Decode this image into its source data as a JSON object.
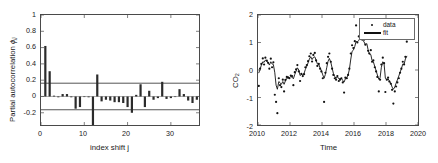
{
  "figure": {
    "background": "#ffffff",
    "axis_color": "#4a4a4a",
    "bar_color": "#2b2b2b",
    "bound_color": "#555555",
    "marker_color": "#111111",
    "line_color": "#111111"
  },
  "panels": {
    "left": {
      "name": "partial-autocorrelation-plot",
      "ylabel_main": "Partial autocorrelation ",
      "ylabel_symbol": "ϕ",
      "ylabel_sub": "jj",
      "xlabel": "index shift j",
      "yticks": [
        "1",
        "0.8",
        "0.6",
        "0.4",
        "0.2",
        "0",
        "-0.2"
      ],
      "xticks": [
        "0",
        "10",
        "20",
        "30"
      ]
    },
    "right": {
      "name": "co2-timeseries-plot",
      "ylabel_main": "CO",
      "ylabel_sub": "2",
      "xlabel": "Time",
      "yticks": [
        "2",
        "1",
        "0",
        "-1",
        "-2"
      ],
      "xticks": [
        "2010",
        "2012",
        "2014",
        "2016",
        "2018",
        "2020"
      ],
      "legend": {
        "data_label": "data",
        "fit_label": "fit"
      }
    }
  },
  "chart_data": [
    {
      "type": "bar",
      "name": "partial-autocorrelation",
      "title": "",
      "xlabel": "index shift j",
      "ylabel": "Partial autocorrelation ϕ_jj",
      "xlim": [
        0,
        36.5
      ],
      "ylim": [
        -0.35,
        1.0
      ],
      "xticks": [
        0,
        10,
        20,
        30
      ],
      "yticks": [
        -0.2,
        0,
        0.2,
        0.4,
        0.6,
        0.8,
        1
      ],
      "grid": false,
      "confidence_bounds": [
        0.163,
        -0.163
      ],
      "x": [
        1,
        2,
        3,
        4,
        5,
        6,
        7,
        8,
        9,
        10,
        11,
        12,
        13,
        14,
        15,
        16,
        17,
        18,
        19,
        20,
        21,
        22,
        23,
        24,
        25,
        26,
        27,
        28,
        29,
        30,
        31,
        32,
        33,
        34,
        35,
        36
      ],
      "values": [
        0.62,
        0.31,
        0.01,
        -0.01,
        0.03,
        0.03,
        -0.01,
        -0.15,
        -0.13,
        0.0,
        -0.01,
        -0.35,
        0.27,
        -0.06,
        -0.04,
        -0.05,
        -0.07,
        -0.07,
        -0.08,
        -0.13,
        -0.2,
        0.02,
        0.15,
        -0.13,
        0.07,
        -0.04,
        -0.02,
        0.18,
        -0.03,
        -0.02,
        0.0,
        0.09,
        0.03,
        -0.05,
        -0.08,
        -0.04
      ]
    },
    {
      "type": "scatter",
      "name": "co2-anomaly-timeseries",
      "title": "",
      "xlabel": "Time",
      "ylabel": "CO2",
      "xlim": [
        2010,
        2020
      ],
      "ylim": [
        -2,
        2
      ],
      "xticks": [
        2010,
        2012,
        2014,
        2016,
        2018,
        2020
      ],
      "yticks": [
        -2,
        -1,
        0,
        1,
        2
      ],
      "grid": false,
      "legend_position": "top-right",
      "series": [
        {
          "name": "data",
          "style": "points",
          "x": [
            2010.05,
            2010.13,
            2010.21,
            2010.3,
            2010.38,
            2010.46,
            2010.55,
            2010.63,
            2010.71,
            2010.8,
            2010.88,
            2010.96,
            2011.05,
            2011.13,
            2011.21,
            2011.3,
            2011.38,
            2011.46,
            2011.55,
            2011.63,
            2011.71,
            2011.8,
            2011.88,
            2011.96,
            2012.05,
            2012.13,
            2012.21,
            2012.3,
            2012.38,
            2012.46,
            2012.55,
            2012.63,
            2012.71,
            2012.8,
            2012.88,
            2012.96,
            2013.05,
            2013.13,
            2013.21,
            2013.3,
            2013.38,
            2013.46,
            2013.55,
            2013.63,
            2013.71,
            2013.8,
            2013.88,
            2013.96,
            2014.05,
            2014.13,
            2014.21,
            2014.3,
            2014.38,
            2014.46,
            2014.55,
            2014.63,
            2014.71,
            2014.8,
            2014.88,
            2014.96,
            2015.05,
            2015.13,
            2015.21,
            2015.3,
            2015.38,
            2015.46,
            2015.55,
            2015.63,
            2015.71,
            2015.8,
            2015.88,
            2015.96,
            2016.05,
            2016.13,
            2016.21,
            2016.3,
            2016.38,
            2016.46,
            2016.55,
            2016.63,
            2016.71,
            2016.8,
            2016.88,
            2016.96,
            2017.05,
            2017.13,
            2017.21,
            2017.3,
            2017.38,
            2017.46,
            2017.55,
            2017.63,
            2017.71,
            2017.8,
            2017.88,
            2017.96,
            2018.05,
            2018.13,
            2018.21,
            2018.3,
            2018.38,
            2018.46,
            2018.55,
            2018.63,
            2018.71,
            2018.8,
            2018.88,
            2018.96,
            2019.05,
            2019.13,
            2019.21,
            2019.3
          ],
          "y": [
            -0.58,
            0.05,
            0.22,
            0.42,
            0.2,
            0.45,
            0.34,
            0.26,
            0.05,
            0.41,
            0.1,
            0.28,
            -0.9,
            -1.16,
            -1.57,
            -0.3,
            -0.55,
            -0.62,
            -0.35,
            -0.78,
            -0.36,
            -0.25,
            -0.27,
            -0.3,
            -0.2,
            -0.22,
            -0.55,
            -0.08,
            0.02,
            0.18,
            -0.05,
            -0.4,
            -0.14,
            -0.22,
            -0.15,
            0.1,
            0.18,
            0.32,
            0.5,
            0.6,
            0.31,
            0.55,
            0.62,
            0.35,
            0.15,
            0.22,
            0.05,
            -0.05,
            -0.3,
            -1.16,
            -0.1,
            0.25,
            0.48,
            0.6,
            0.3,
            0.05,
            -0.18,
            -0.3,
            -0.35,
            -0.22,
            -0.4,
            -0.35,
            -0.3,
            -0.45,
            -0.82,
            -0.28,
            -0.3,
            -0.18,
            0.05,
            0.6,
            0.9,
            0.8,
            1.05,
            1.62,
            1.0,
            1.22,
            1.73,
            1.12,
            1.18,
            1.1,
            0.92,
            1.25,
            0.7,
            0.6,
            0.72,
            0.3,
            0.35,
            0.1,
            -0.05,
            -0.25,
            -0.78,
            -0.35,
            0.2,
            0.45,
            0.25,
            -0.8,
            -0.35,
            -0.28,
            -0.42,
            -0.5,
            -0.72,
            -1.22,
            -0.78,
            -0.6,
            -0.45,
            -0.3,
            -0.1,
            0.05,
            0.3,
            0.2,
            0.48,
            1.03
          ]
        },
        {
          "name": "fit",
          "style": "line",
          "x": [
            2010.05,
            2010.13,
            2010.21,
            2010.3,
            2010.38,
            2010.46,
            2010.55,
            2010.63,
            2010.71,
            2010.8,
            2010.88,
            2010.96,
            2011.05,
            2011.13,
            2011.21,
            2011.3,
            2011.38,
            2011.46,
            2011.55,
            2011.63,
            2011.71,
            2011.8,
            2011.88,
            2011.96,
            2012.05,
            2012.13,
            2012.21,
            2012.3,
            2012.38,
            2012.46,
            2012.55,
            2012.63,
            2012.71,
            2012.8,
            2012.88,
            2012.96,
            2013.05,
            2013.13,
            2013.21,
            2013.3,
            2013.38,
            2013.46,
            2013.55,
            2013.63,
            2013.71,
            2013.8,
            2013.88,
            2013.96,
            2014.05,
            2014.13,
            2014.21,
            2014.3,
            2014.38,
            2014.46,
            2014.55,
            2014.63,
            2014.71,
            2014.8,
            2014.88,
            2014.96,
            2015.05,
            2015.13,
            2015.21,
            2015.3,
            2015.38,
            2015.46,
            2015.55,
            2015.63,
            2015.71,
            2015.8,
            2015.88,
            2015.96,
            2016.05,
            2016.13,
            2016.21,
            2016.3,
            2016.38,
            2016.46,
            2016.55,
            2016.63,
            2016.71,
            2016.8,
            2016.88,
            2016.96,
            2017.05,
            2017.13,
            2017.21,
            2017.3,
            2017.38,
            2017.46,
            2017.55,
            2017.63,
            2017.71,
            2017.8,
            2017.88,
            2017.96,
            2018.05,
            2018.13,
            2018.21,
            2018.3,
            2018.38,
            2018.46,
            2018.55,
            2018.63,
            2018.71,
            2018.8,
            2018.88,
            2018.96,
            2019.05,
            2019.13,
            2019.21,
            2019.3
          ],
          "y": [
            -0.1,
            0.02,
            0.18,
            0.3,
            0.28,
            0.36,
            0.32,
            0.28,
            0.18,
            0.3,
            0.22,
            0.2,
            -0.1,
            -0.55,
            -0.7,
            -0.42,
            -0.46,
            -0.52,
            -0.42,
            -0.52,
            -0.4,
            -0.3,
            -0.28,
            -0.28,
            -0.24,
            -0.26,
            -0.32,
            -0.16,
            -0.04,
            0.08,
            0.0,
            -0.2,
            -0.16,
            -0.18,
            -0.12,
            0.02,
            0.14,
            0.26,
            0.4,
            0.48,
            0.38,
            0.46,
            0.48,
            0.36,
            0.22,
            0.2,
            0.08,
            -0.02,
            -0.18,
            -0.3,
            -0.16,
            0.1,
            0.32,
            0.42,
            0.28,
            0.08,
            -0.12,
            -0.24,
            -0.3,
            -0.24,
            -0.32,
            -0.32,
            -0.3,
            -0.38,
            -0.44,
            -0.32,
            -0.28,
            -0.18,
            0.02,
            0.4,
            0.68,
            0.72,
            0.86,
            1.04,
            1.02,
            1.08,
            1.16,
            1.1,
            1.08,
            1.02,
            0.92,
            0.96,
            0.74,
            0.58,
            0.56,
            0.34,
            0.3,
            0.12,
            -0.02,
            -0.18,
            -0.34,
            -0.28,
            0.1,
            0.3,
            0.22,
            -0.3,
            -0.36,
            -0.32,
            -0.4,
            -0.48,
            -0.62,
            -0.7,
            -0.62,
            -0.48,
            -0.36,
            -0.22,
            -0.08,
            0.04,
            0.22,
            0.2,
            0.4,
            0.5
          ]
        }
      ]
    }
  ]
}
